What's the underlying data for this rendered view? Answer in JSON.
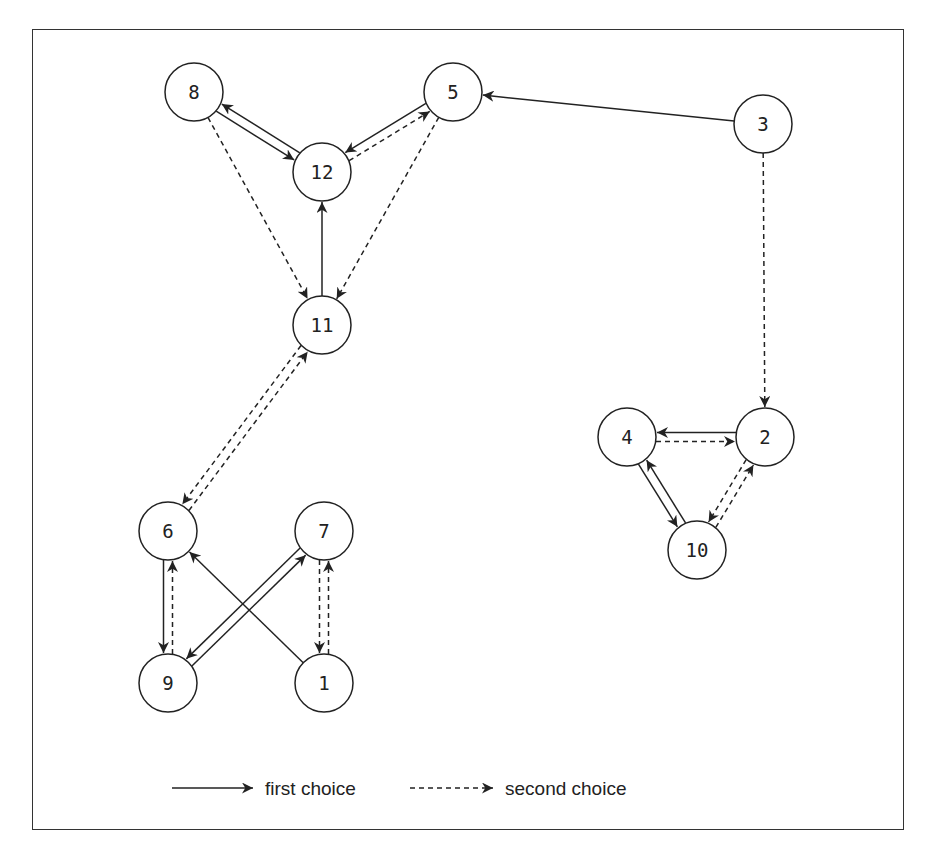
{
  "diagram": {
    "type": "directed-graph",
    "node_radius": 29,
    "nodes": [
      {
        "id": "8",
        "label": "8",
        "x": 194,
        "y": 92
      },
      {
        "id": "5",
        "label": "5",
        "x": 453,
        "y": 92
      },
      {
        "id": "3",
        "label": "3",
        "x": 763,
        "y": 124
      },
      {
        "id": "12",
        "label": "12",
        "x": 322,
        "y": 172
      },
      {
        "id": "11",
        "label": "11",
        "x": 322,
        "y": 325
      },
      {
        "id": "4",
        "label": "4",
        "x": 627,
        "y": 437
      },
      {
        "id": "2",
        "label": "2",
        "x": 765,
        "y": 437
      },
      {
        "id": "10",
        "label": "10",
        "x": 697,
        "y": 550
      },
      {
        "id": "6",
        "label": "6",
        "x": 168,
        "y": 531
      },
      {
        "id": "7",
        "label": "7",
        "x": 324,
        "y": 531
      },
      {
        "id": "9",
        "label": "9",
        "x": 168,
        "y": 683
      },
      {
        "id": "1",
        "label": "1",
        "x": 324,
        "y": 683
      }
    ],
    "edges": [
      {
        "from": "8",
        "to": "12",
        "type": "first"
      },
      {
        "from": "12",
        "to": "8",
        "type": "first"
      },
      {
        "from": "12",
        "to": "5",
        "type": "second"
      },
      {
        "from": "5",
        "to": "12",
        "type": "first"
      },
      {
        "from": "8",
        "to": "11",
        "type": "second"
      },
      {
        "from": "5",
        "to": "11",
        "type": "second"
      },
      {
        "from": "11",
        "to": "12",
        "type": "first"
      },
      {
        "from": "3",
        "to": "5",
        "type": "first"
      },
      {
        "from": "3",
        "to": "2",
        "type": "second"
      },
      {
        "from": "6",
        "to": "11",
        "type": "second"
      },
      {
        "from": "11",
        "to": "6",
        "type": "second"
      },
      {
        "from": "4",
        "to": "2",
        "type": "second"
      },
      {
        "from": "2",
        "to": "4",
        "type": "first"
      },
      {
        "from": "4",
        "to": "10",
        "type": "first"
      },
      {
        "from": "10",
        "to": "4",
        "type": "first"
      },
      {
        "from": "2",
        "to": "10",
        "type": "second"
      },
      {
        "from": "10",
        "to": "2",
        "type": "second"
      },
      {
        "from": "6",
        "to": "9",
        "type": "first"
      },
      {
        "from": "9",
        "to": "6",
        "type": "second"
      },
      {
        "from": "7",
        "to": "9",
        "type": "first"
      },
      {
        "from": "9",
        "to": "7",
        "type": "first"
      },
      {
        "from": "1",
        "to": "6",
        "type": "first"
      },
      {
        "from": "1",
        "to": "7",
        "type": "second"
      },
      {
        "from": "7",
        "to": "1",
        "type": "second"
      }
    ]
  },
  "legend": {
    "first": {
      "label": "first choice",
      "style": "solid"
    },
    "second": {
      "label": "second choice",
      "style": "dashed"
    }
  },
  "colors": {
    "stroke": "#222222",
    "background": "#ffffff"
  }
}
